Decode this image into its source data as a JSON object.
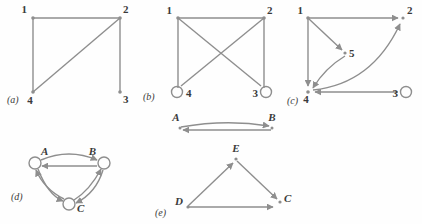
{
  "figure": {
    "background_color": "#fefefe",
    "stroke_color": "#8e8e8e",
    "text_color": "#3a3a3a",
    "panels": [
      {
        "key": "a",
        "label": "(a)",
        "label_x": 7,
        "label_y": 103,
        "directed": false,
        "nodes": [
          {
            "id": "1",
            "label": "1",
            "x": 33,
            "y": 18,
            "label_x": 27,
            "label_y": 13,
            "dot": true,
            "self_loop": false
          },
          {
            "id": "2",
            "label": "2",
            "x": 120,
            "y": 18,
            "label_x": 123,
            "label_y": 13,
            "dot": true,
            "self_loop": false
          },
          {
            "id": "3",
            "label": "3",
            "x": 120,
            "y": 92,
            "label_x": 123,
            "label_y": 103,
            "dot": true,
            "self_loop": false
          },
          {
            "id": "4",
            "label": "4",
            "x": 33,
            "y": 92,
            "label_x": 30,
            "label_y": 104,
            "dot": true,
            "self_loop": false
          }
        ],
        "edges": [
          {
            "from": "1",
            "to": "2",
            "kind": "line",
            "arrow": false
          },
          {
            "from": "1",
            "to": "4",
            "kind": "line",
            "arrow": false
          },
          {
            "from": "2",
            "to": "3",
            "kind": "line",
            "arrow": false
          },
          {
            "from": "2",
            "to": "4",
            "kind": "line",
            "arrow": false
          }
        ]
      },
      {
        "key": "b",
        "label": "(b)",
        "label_x": 143,
        "label_y": 100,
        "directed": false,
        "nodes": [
          {
            "id": "1",
            "label": "1",
            "x": 178,
            "y": 18,
            "label_x": 170,
            "label_y": 14,
            "dot": true,
            "self_loop": false
          },
          {
            "id": "2",
            "label": "2",
            "x": 264,
            "y": 18,
            "label_x": 266,
            "label_y": 14,
            "dot": true,
            "self_loop": false
          },
          {
            "id": "3",
            "label": "3",
            "x": 264,
            "y": 92,
            "label_x": 253,
            "label_y": 100,
            "dot": false,
            "self_loop": true,
            "loop_side": "right"
          },
          {
            "id": "4",
            "label": "4",
            "x": 178,
            "y": 92,
            "label_x": 186,
            "label_y": 100,
            "dot": false,
            "self_loop": true,
            "loop_side": "left"
          }
        ],
        "edges": [
          {
            "from": "1",
            "to": "2",
            "kind": "line",
            "arrow": false
          },
          {
            "from": "1",
            "to": "4",
            "kind": "line",
            "arrow": false
          },
          {
            "from": "1",
            "to": "3",
            "kind": "line",
            "arrow": false
          },
          {
            "from": "2",
            "to": "4",
            "kind": "line",
            "arrow": false
          },
          {
            "from": "2",
            "to": "3",
            "kind": "line",
            "arrow": false
          }
        ]
      },
      {
        "key": "c",
        "label": "(c)",
        "label_x": 287,
        "label_y": 104,
        "directed": true,
        "nodes": [
          {
            "id": "1",
            "label": "1",
            "x": 308,
            "y": 18,
            "label_x": 300,
            "label_y": 14,
            "dot": true,
            "self_loop": false
          },
          {
            "id": "2",
            "label": "2",
            "x": 404,
            "y": 18,
            "label_x": 408,
            "label_y": 14,
            "dot": true,
            "self_loop": false
          },
          {
            "id": "3",
            "label": "3",
            "x": 404,
            "y": 92,
            "label_x": 393,
            "label_y": 100,
            "dot": false,
            "self_loop": true,
            "loop_side": "right"
          },
          {
            "id": "4",
            "label": "4",
            "x": 308,
            "y": 92,
            "label_x": 303,
            "label_y": 103,
            "dot": true,
            "self_loop": false
          },
          {
            "id": "5",
            "label": "5",
            "x": 345,
            "y": 53,
            "label_x": 349,
            "label_y": 57,
            "dot": true,
            "self_loop": false
          }
        ],
        "edges": [
          {
            "from": "1",
            "to": "2",
            "kind": "line",
            "arrow": true
          },
          {
            "from": "1",
            "to": "4",
            "kind": "line",
            "arrow": true
          },
          {
            "from": "1",
            "to": "5",
            "kind": "line",
            "arrow": true
          },
          {
            "from": "5",
            "to": "4",
            "kind": "curve",
            "arrow": true
          },
          {
            "from": "4",
            "to": "2",
            "kind": "curve",
            "arrow": true
          },
          {
            "from": "3",
            "to": "4",
            "kind": "line",
            "arrow": true
          }
        ]
      },
      {
        "key": "d",
        "label": "(d)",
        "label_x": 11,
        "label_y": 200,
        "directed": true,
        "nodes": [
          {
            "id": "A",
            "label": "A",
            "x": 35,
            "y": 163,
            "label_x": 41,
            "label_y": 155,
            "dot": false,
            "self_loop": false,
            "circle": true
          },
          {
            "id": "B",
            "label": "B",
            "x": 103,
            "y": 163,
            "label_x": 92,
            "label_y": 155,
            "dot": false,
            "self_loop": false,
            "circle": true
          },
          {
            "id": "C",
            "label": "C",
            "x": 69,
            "y": 204,
            "label_x": 78,
            "label_y": 211,
            "dot": false,
            "self_loop": false,
            "circle": true
          }
        ],
        "edges": [
          {
            "from": "A",
            "to": "B",
            "kind": "curve",
            "arrow": true
          },
          {
            "from": "B",
            "to": "A",
            "kind": "line",
            "arrow": true
          },
          {
            "from": "A",
            "to": "C",
            "kind": "curve",
            "arrow": true
          },
          {
            "from": "C",
            "to": "A",
            "kind": "curve",
            "arrow": true
          },
          {
            "from": "B",
            "to": "C",
            "kind": "curve",
            "arrow": true
          },
          {
            "from": "C",
            "to": "B",
            "kind": "curve",
            "arrow": true
          }
        ]
      },
      {
        "key": "e",
        "label": "(e)",
        "label_x": 155,
        "label_y": 216,
        "directed": true,
        "nodes": [
          {
            "id": "D",
            "label": "D",
            "x": 188,
            "y": 206,
            "label_x": 176,
            "label_y": 205,
            "dot": true,
            "self_loop": false
          },
          {
            "id": "E",
            "label": "E",
            "x": 236,
            "y": 159,
            "label_x": 231,
            "label_y": 152,
            "dot": true,
            "self_loop": false
          },
          {
            "id": "C",
            "label": "C",
            "x": 280,
            "y": 202,
            "label_x": 284,
            "label_y": 201,
            "dot": true,
            "self_loop": false
          }
        ],
        "edges": [
          {
            "from": "D",
            "to": "E",
            "kind": "line",
            "arrow": true
          },
          {
            "from": "E",
            "to": "C",
            "kind": "line",
            "arrow": true
          },
          {
            "from": "D",
            "to": "C",
            "kind": "line",
            "arrow": true
          }
        ]
      },
      {
        "key": "ab",
        "label": "",
        "directed": true,
        "nodes": [
          {
            "id": "A",
            "label": "A",
            "x": 180,
            "y": 127,
            "label_x": 174,
            "label_y": 120,
            "dot": true,
            "self_loop": false
          },
          {
            "id": "B",
            "label": "B",
            "x": 272,
            "y": 127,
            "label_x": 268,
            "label_y": 120,
            "dot": true,
            "self_loop": false
          }
        ],
        "edges": [
          {
            "from": "A",
            "to": "B",
            "kind": "curve",
            "arrow": true
          },
          {
            "from": "B",
            "to": "A",
            "kind": "line",
            "arrow": true
          }
        ]
      }
    ]
  }
}
